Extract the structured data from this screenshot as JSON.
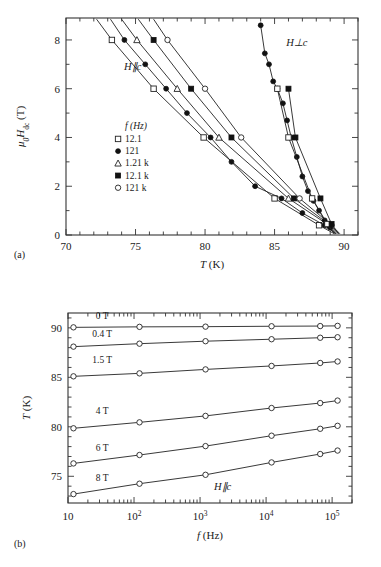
{
  "figure": {
    "panel_a_label": "(a)",
    "panel_b_label": "(b)"
  },
  "chart_data": [
    {
      "id": "panel-a",
      "type": "scatter",
      "title": "",
      "xlabel": "T (K)",
      "ylabel": "μ0Hdc (T)",
      "ylabel_parts": {
        "mu": "μ",
        "mu_sub": "0",
        "H": "H",
        "H_sub": "dc",
        "unit": "(T)"
      },
      "xlim": [
        70,
        91
      ],
      "ylim": [
        0,
        8.9
      ],
      "xticks": [
        70,
        75,
        80,
        85,
        90
      ],
      "xticklabels": [
        "70",
        "75",
        "80",
        "85",
        "90"
      ],
      "xminor_step": 1,
      "yticks": [
        0,
        2,
        4,
        6,
        8
      ],
      "yticklabels": [
        "0",
        "2",
        "4",
        "6",
        "8"
      ],
      "yminor_step": 1,
      "grid": false,
      "annotations": [
        {
          "text": "H∥c",
          "x": 74.8,
          "y": 6.75,
          "name": "h-parallel-c-label"
        },
        {
          "text": "H⊥c",
          "x": 86.6,
          "y": 7.75,
          "name": "h-perp-c-label"
        }
      ],
      "legend": {
        "title": "f (Hz)",
        "position": "inside-left",
        "x": 73.6,
        "y": 4.35,
        "entries": [
          {
            "label": "12.1",
            "marker": "open-square"
          },
          {
            "label": "121",
            "marker": "filled-circle"
          },
          {
            "label": "1.21 k",
            "marker": "open-triangle"
          },
          {
            "label": "12.1 k",
            "marker": "filled-square"
          },
          {
            "label": "121 k",
            "marker": "open-circle"
          }
        ]
      },
      "series": [
        {
          "name": "12.1 Hz H||c",
          "marker": "open-square",
          "branch": "H||c",
          "points": [
            [
              72.2,
              8.85
            ],
            [
              73.3,
              8.0
            ],
            [
              76.3,
              6.0
            ],
            [
              79.9,
              4.0
            ],
            [
              85.0,
              1.5
            ],
            [
              88.2,
              0.4
            ],
            [
              89.3,
              0.05
            ]
          ]
        },
        {
          "name": "121 Hz H||c",
          "marker": "filled-circle",
          "branch": "H||c",
          "points": [
            [
              73.2,
              8.85
            ],
            [
              74.2,
              8.0
            ],
            [
              75.7,
              7.0
            ],
            [
              77.2,
              6.0
            ],
            [
              78.7,
              5.0
            ],
            [
              80.4,
              4.0
            ],
            [
              81.9,
              3.0
            ],
            [
              83.6,
              2.0
            ],
            [
              85.5,
              1.5
            ],
            [
              87.0,
              0.9
            ],
            [
              88.6,
              0.4
            ],
            [
              89.4,
              0.05
            ]
          ]
        },
        {
          "name": "1.21 kHz H||c",
          "marker": "open-triangle",
          "branch": "H||c",
          "points": [
            [
              74.0,
              8.85
            ],
            [
              75.1,
              8.0
            ],
            [
              78.0,
              6.0
            ],
            [
              81.0,
              4.0
            ],
            [
              86.0,
              1.5
            ],
            [
              88.9,
              0.4
            ],
            [
              89.5,
              0.05
            ]
          ]
        },
        {
          "name": "12.1 kHz H||c",
          "marker": "filled-square",
          "branch": "H||c",
          "points": [
            [
              75.2,
              8.85
            ],
            [
              76.3,
              8.0
            ],
            [
              79.0,
              6.0
            ],
            [
              81.9,
              4.0
            ],
            [
              86.4,
              1.5
            ],
            [
              89.0,
              0.4
            ],
            [
              89.6,
              0.05
            ]
          ]
        },
        {
          "name": "121 kHz H||c",
          "marker": "open-circle",
          "branch": "H||c",
          "points": [
            [
              76.3,
              8.85
            ],
            [
              77.3,
              8.0
            ],
            [
              80.0,
              6.0
            ],
            [
              82.6,
              4.0
            ],
            [
              86.8,
              1.5
            ],
            [
              89.1,
              0.4
            ],
            [
              89.7,
              0.05
            ]
          ]
        },
        {
          "name": "121 Hz H⊥c",
          "marker": "filled-circle",
          "branch": "H⊥c",
          "points": [
            [
              84.0,
              8.6
            ],
            [
              84.3,
              7.45
            ],
            [
              84.6,
              7.0
            ],
            [
              84.9,
              6.3
            ],
            [
              85.2,
              6.0
            ],
            [
              85.6,
              5.4
            ],
            [
              85.9,
              4.7
            ],
            [
              86.2,
              4.0
            ],
            [
              86.6,
              3.2
            ],
            [
              87.0,
              2.4
            ],
            [
              87.4,
              1.8
            ],
            [
              87.8,
              1.4
            ],
            [
              88.2,
              1.0
            ],
            [
              88.6,
              0.6
            ],
            [
              89.0,
              0.3
            ],
            [
              89.4,
              0.05
            ]
          ]
        },
        {
          "name": "12.1 Hz H⊥c",
          "marker": "open-square",
          "branch": "H⊥c",
          "points": [
            [
              85.2,
              6.0
            ],
            [
              86.0,
              4.0
            ],
            [
              87.7,
              1.5
            ],
            [
              88.8,
              0.45
            ],
            [
              89.3,
              0.05
            ]
          ]
        },
        {
          "name": "12.1 kHz H⊥c",
          "marker": "filled-square",
          "branch": "H⊥c",
          "points": [
            [
              86.0,
              6.0
            ],
            [
              86.5,
              4.0
            ],
            [
              88.3,
              1.5
            ],
            [
              89.1,
              0.45
            ],
            [
              89.6,
              0.05
            ]
          ]
        }
      ]
    },
    {
      "id": "panel-b",
      "type": "line",
      "title": "",
      "xlabel": "f (Hz)",
      "ylabel": "T (K)",
      "xscale": "log",
      "xlim": [
        10,
        200000
      ],
      "ylim": [
        72.3,
        91.5
      ],
      "xticks": [
        10,
        100,
        1000,
        10000,
        100000
      ],
      "xticklabels": [
        "10",
        "10²",
        "10³",
        "10⁴",
        "10⁵"
      ],
      "yticks": [
        75,
        80,
        85,
        90
      ],
      "yticklabels": [
        "75",
        "80",
        "85",
        "90"
      ],
      "yminor_step": 1,
      "grid": false,
      "annotations": [
        {
          "text": "H∥c",
          "x": 2200,
          "y": 73.6,
          "name": "h-parallel-c-label-b"
        }
      ],
      "series": [
        {
          "name": "0 T",
          "field_label": "0 T",
          "marker": "open-circle",
          "label_x": 33,
          "label_y": 90.85,
          "points": [
            [
              12.1,
              90.05
            ],
            [
              121,
              90.1
            ],
            [
              1210,
              90.12
            ],
            [
              12100,
              90.16
            ],
            [
              66000,
              90.18
            ],
            [
              121000,
              90.2
            ]
          ]
        },
        {
          "name": "0.4 T",
          "field_label": "0.4 T",
          "marker": "open-circle",
          "label_x": 33,
          "label_y": 89.1,
          "points": [
            [
              12.1,
              88.1
            ],
            [
              121,
              88.4
            ],
            [
              1210,
              88.65
            ],
            [
              12100,
              88.85
            ],
            [
              66000,
              89.0
            ],
            [
              121000,
              89.05
            ]
          ]
        },
        {
          "name": "1.5 T",
          "field_label": "1.5 T",
          "marker": "open-circle",
          "label_x": 33,
          "label_y": 86.4,
          "points": [
            [
              12.1,
              85.1
            ],
            [
              121,
              85.4
            ],
            [
              1210,
              85.8
            ],
            [
              12100,
              86.15
            ],
            [
              66000,
              86.45
            ],
            [
              121000,
              86.6
            ]
          ]
        },
        {
          "name": "4 T",
          "field_label": "4 T",
          "marker": "open-circle",
          "label_x": 33,
          "label_y": 81.3,
          "points": [
            [
              12.1,
              79.85
            ],
            [
              121,
              80.45
            ],
            [
              1210,
              81.1
            ],
            [
              12100,
              81.9
            ],
            [
              66000,
              82.4
            ],
            [
              121000,
              82.65
            ]
          ]
        },
        {
          "name": "6 T",
          "field_label": "6 T",
          "marker": "open-circle",
          "label_x": 33,
          "label_y": 77.6,
          "points": [
            [
              12.1,
              76.3
            ],
            [
              121,
              77.15
            ],
            [
              1210,
              78.05
            ],
            [
              12100,
              79.1
            ],
            [
              66000,
              79.8
            ],
            [
              121000,
              80.1
            ]
          ]
        },
        {
          "name": "8 T",
          "field_label": "8 T",
          "marker": "open-circle",
          "label_x": 33,
          "label_y": 74.5,
          "points": [
            [
              12.1,
              73.2
            ],
            [
              121,
              74.25
            ],
            [
              1210,
              75.15
            ],
            [
              12100,
              76.4
            ],
            [
              66000,
              77.25
            ],
            [
              121000,
              77.6
            ]
          ]
        }
      ]
    }
  ]
}
